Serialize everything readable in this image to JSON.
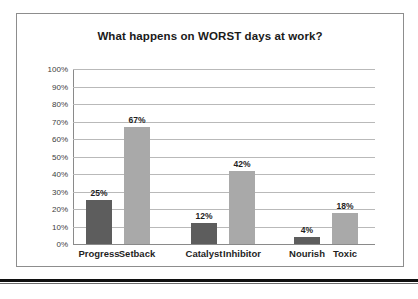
{
  "chart_data": {
    "type": "bar",
    "title": "What happens on WORST days at work?",
    "xlabel": "",
    "ylabel": "",
    "ylim": [
      0,
      100
    ],
    "grid": true,
    "legend": "none",
    "unit": "%",
    "categories": [
      "Progress",
      "Setback",
      "Catalyst",
      "Inhibitor",
      "Nourish",
      "Toxic"
    ],
    "values": [
      25,
      67,
      12,
      42,
      4,
      18
    ],
    "value_labels": [
      "25%",
      "67%",
      "12%",
      "42%",
      "4%",
      "18%"
    ],
    "bar_colors": [
      "#5d5d5d",
      "#a9a9a9",
      "#5d5d5d",
      "#a9a9a9",
      "#5d5d5d",
      "#a9a9a9"
    ],
    "groups": [
      {
        "name": "Progress / Setback",
        "categories": [
          "Progress",
          "Setback"
        ],
        "values": [
          25,
          67
        ]
      },
      {
        "name": "Catalyst / Inhibitor",
        "categories": [
          "Catalyst",
          "Inhibitor"
        ],
        "values": [
          12,
          42
        ]
      },
      {
        "name": "Nourish / Toxic",
        "categories": [
          "Nourish",
          "Toxic"
        ],
        "values": [
          4,
          18
        ]
      }
    ],
    "yticks": [
      100,
      90,
      80,
      70,
      60,
      50,
      40,
      30,
      20,
      10,
      0
    ],
    "ytick_labels": [
      "100%",
      "90%",
      "80%",
      "70%",
      "60%",
      "50%",
      "40%",
      "30%",
      "20%",
      "10%",
      "0%"
    ]
  },
  "colors": {
    "bar_dark": "#5d5d5d",
    "bar_light": "#a9a9a9",
    "grid": "#b9b9b9",
    "axis": "#8a8a8a",
    "frame": "#8d8d8d",
    "rule": "#101010",
    "text": "#1f1f1f",
    "background": "#ffffff"
  }
}
